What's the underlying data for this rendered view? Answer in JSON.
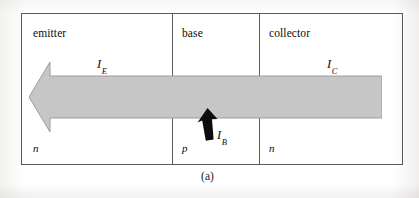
{
  "figure": {
    "caption": "(a)",
    "regions": [
      {
        "id": "emitter",
        "name": "emitter",
        "doping": "n"
      },
      {
        "id": "base",
        "name": "base",
        "doping": "p"
      },
      {
        "id": "collector",
        "name": "collector",
        "doping": "n"
      }
    ],
    "currents": [
      {
        "id": "emitter-current",
        "symbol": "I",
        "subscript": "E",
        "direction": "left"
      },
      {
        "id": "collector-current",
        "symbol": "I",
        "subscript": "C",
        "direction": "left"
      },
      {
        "id": "base-current",
        "symbol": "I",
        "subscript": "B",
        "direction": "up"
      }
    ],
    "colors": {
      "border": "#5b5b5b",
      "main_arrow_fill": "#c6c6c6",
      "main_arrow_stroke": "#9a9a9a",
      "base_arrow_fill": "#0d0d0d",
      "background": "#ffffff",
      "text": "#0d0d0d"
    }
  }
}
